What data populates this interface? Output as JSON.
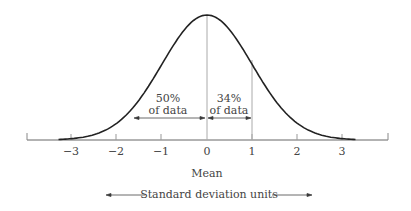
{
  "chart_data": {
    "type": "line",
    "xlabel": "Standard deviation units",
    "ylabel": "",
    "x_ticks": [
      "-3",
      "-2",
      "-1",
      "0",
      "1",
      "2",
      "3"
    ],
    "xlim": [
      -3.8,
      4.1
    ],
    "center_label": "Mean",
    "curve": "standard normal density",
    "annotations": [
      {
        "text_line1": "50%",
        "text_line2": "of data",
        "from": -1.6,
        "to": 0
      },
      {
        "text_line1": "34%",
        "text_line2": "of data",
        "from": 0,
        "to": 1
      }
    ],
    "grid": false,
    "legend": null
  },
  "labels": {
    "mean": "Mean",
    "axis_title": "Standard deviation units",
    "ann50_1": "50%",
    "ann50_2": "of data",
    "ann34_1": "34%",
    "ann34_2": "of data",
    "ticks": [
      "−3",
      "−2",
      "−1",
      "0",
      "1",
      "2",
      "3"
    ]
  }
}
